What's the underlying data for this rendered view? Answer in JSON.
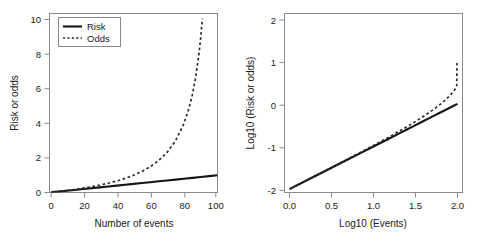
{
  "chart_data": [
    {
      "panel": "left",
      "type": "line",
      "title": "",
      "xlabel": "Number of events",
      "ylabel": "Risk or odds",
      "xlim": [
        0,
        100
      ],
      "ylim": [
        0,
        10.4
      ],
      "xticks": [
        0,
        20,
        40,
        60,
        80,
        100
      ],
      "xticklabels": [
        "0",
        "20",
        "40",
        "60",
        "80",
        "100"
      ],
      "yticks": [
        0,
        2,
        4,
        6,
        8,
        10
      ],
      "yticklabels": [
        "0",
        "2",
        "4",
        "6",
        "8",
        "10"
      ],
      "grid": false,
      "legend": {
        "position": "top-left",
        "entries": [
          {
            "label": "Risk",
            "style": "solid"
          },
          {
            "label": "Odds",
            "style": "dotted"
          }
        ]
      },
      "series": [
        {
          "name": "Risk",
          "style": "solid",
          "x": [
            1,
            5,
            10,
            15,
            20,
            25,
            30,
            35,
            40,
            45,
            50,
            55,
            60,
            65,
            70,
            75,
            80,
            85,
            90,
            95,
            100
          ],
          "values": [
            0.01,
            0.05,
            0.1,
            0.15,
            0.2,
            0.25,
            0.3,
            0.35,
            0.4,
            0.45,
            0.5,
            0.55,
            0.6,
            0.65,
            0.7,
            0.75,
            0.8,
            0.85,
            0.9,
            0.95,
            1.0
          ]
        },
        {
          "name": "Odds",
          "style": "dotted",
          "x": [
            1,
            5,
            10,
            15,
            20,
            25,
            30,
            35,
            40,
            45,
            50,
            55,
            60,
            65,
            70,
            75,
            80,
            83,
            85,
            87,
            89,
            90,
            91
          ],
          "values": [
            0.0101,
            0.0526,
            0.1111,
            0.1765,
            0.25,
            0.3333,
            0.4286,
            0.5385,
            0.6667,
            0.8182,
            1.0,
            1.2222,
            1.5,
            1.8571,
            2.3333,
            3.0,
            4.0,
            4.882,
            5.667,
            6.692,
            8.091,
            9.0,
            10.111
          ]
        }
      ]
    },
    {
      "panel": "right",
      "type": "line",
      "title": "",
      "xlabel": "Log10 (Events)",
      "ylabel": "Log10 (Risk or odds)",
      "xlim": [
        -0.06,
        2.06
      ],
      "ylim": [
        -2.08,
        2.12
      ],
      "xticks": [
        0.0,
        0.5,
        1.0,
        1.5,
        2.0
      ],
      "xticklabels": [
        "0.0",
        "0.5",
        "1.0",
        "1.5",
        "2.0"
      ],
      "yticks": [
        -2,
        -1,
        0,
        1,
        2
      ],
      "yticklabels": [
        "-2",
        "-1",
        "0",
        "1",
        "2"
      ],
      "grid": false,
      "series": [
        {
          "name": "Risk",
          "style": "solid",
          "x": [
            0.0,
            0.301,
            0.4771,
            0.699,
            0.8451,
            1.0,
            1.1761,
            1.301,
            1.3979,
            1.4771,
            1.5441,
            1.6021,
            1.6532,
            1.699,
            1.7404,
            1.7782,
            1.8451,
            1.9031,
            1.9542,
            2.0
          ],
          "values": [
            -2.0,
            -1.699,
            -1.5229,
            -1.301,
            -1.1549,
            -1.0,
            -0.8239,
            -0.699,
            -0.6021,
            -0.5229,
            -0.4559,
            -0.3979,
            -0.3468,
            -0.301,
            -0.2596,
            -0.2218,
            -0.1549,
            -0.0969,
            -0.0458,
            0.0
          ]
        },
        {
          "name": "Odds",
          "style": "dotted",
          "x": [
            0.0,
            0.301,
            0.4771,
            0.699,
            0.8451,
            1.0,
            1.1761,
            1.301,
            1.3979,
            1.4771,
            1.5441,
            1.6021,
            1.6532,
            1.699,
            1.7404,
            1.7782,
            1.8451,
            1.9031,
            1.9294,
            1.9494,
            1.9638,
            1.9731,
            1.9823,
            1.9912,
            1.9956
          ],
          "values": [
            -1.9957,
            -1.6946,
            -1.5157,
            -1.2882,
            -1.1367,
            -0.9747,
            -0.7866,
            -0.6478,
            -0.5361,
            -0.4413,
            -0.3585,
            -0.284,
            -0.216,
            -0.153,
            -0.0936,
            -0.0374,
            0.0711,
            0.1806,
            0.2386,
            0.2868,
            0.3245,
            0.3507,
            0.3788,
            0.409,
            1.0141
          ]
        }
      ]
    }
  ],
  "panels": {
    "left": {
      "xlabel": "Number of events",
      "ylabel": "Risk or odds",
      "xticklabels": [
        "0",
        "20",
        "40",
        "60",
        "80",
        "100"
      ],
      "yticklabels": [
        "0",
        "2",
        "4",
        "6",
        "8",
        "10"
      ],
      "legend": {
        "risk_label": "Risk",
        "odds_label": "Odds"
      }
    },
    "right": {
      "xlabel": "Log10 (Events)",
      "ylabel": "Log10 (Risk or odds)",
      "xticklabels": [
        "0.0",
        "0.5",
        "1.0",
        "1.5",
        "2.0"
      ],
      "yticklabels": [
        "-2",
        "-1",
        "0",
        "1",
        "2"
      ]
    }
  },
  "colors": {
    "risk_line": "#141414",
    "odds_line": "#2b2b2b",
    "axis": "#8a8a8a",
    "text": "#1a1a1a",
    "background": "#ffffff"
  }
}
